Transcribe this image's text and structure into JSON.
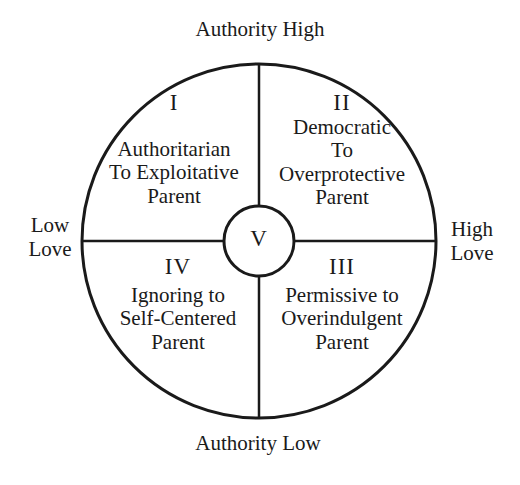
{
  "diagram": {
    "axes": {
      "top": "Authority High",
      "bottom": "Authority Low",
      "left": [
        "Low",
        "Love"
      ],
      "right": [
        "High",
        "Love"
      ]
    },
    "quadrants": [
      {
        "numeral": "I",
        "lines": [
          "Authoritarian",
          "To Exploitative",
          "Parent"
        ]
      },
      {
        "numeral": "II",
        "lines": [
          "Democratic",
          "To",
          "Overprotective",
          "Parent"
        ]
      },
      {
        "numeral": "III",
        "lines": [
          "Permissive to",
          "Overindulgent",
          "Parent"
        ]
      },
      {
        "numeral": "IV",
        "lines": [
          "Ignoring to",
          "Self-Centered",
          "Parent"
        ]
      }
    ],
    "center": {
      "numeral": "V"
    },
    "colors": {
      "line": "#1a1a1a",
      "background": "#ffffff"
    }
  }
}
